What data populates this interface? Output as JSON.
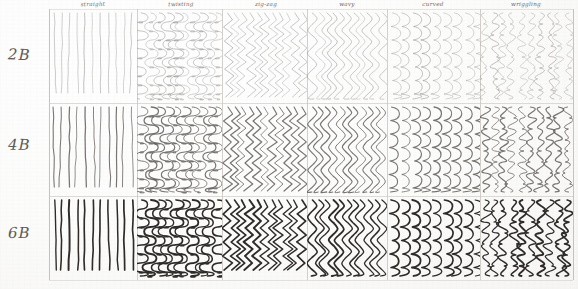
{
  "sheet": {
    "title": "Pencil mark-making chart",
    "description": "Hand-drawn grid of six stroke types rendered in three pencil grades",
    "paper_color": "#fdfdfc",
    "rule_color": "#b9b4ad"
  },
  "rows": [
    {
      "id": "row-2b",
      "label": "2B",
      "y": 56,
      "top": 9,
      "bottom": 103,
      "darkness": 0.3,
      "stroke_width": 0.62,
      "ink": "#8e8a86"
    },
    {
      "id": "row-4b",
      "label": "4B",
      "y": 146,
      "top": 103,
      "bottom": 196,
      "darkness": 0.62,
      "stroke_width": 1.0,
      "ink": "#5d5955"
    },
    {
      "id": "row-6b",
      "label": "6B",
      "y": 234,
      "top": 196,
      "bottom": 280,
      "darkness": 1.0,
      "stroke_width": 1.55,
      "ink": "#2e2b28"
    }
  ],
  "columns": [
    {
      "id": "col-straight",
      "label": "straight",
      "x": 49,
      "width": 88,
      "label_cx": 93,
      "stroke": "straight",
      "bundles": 3,
      "lines_per_bundle": 4
    },
    {
      "id": "col-twisting",
      "label": "twisting",
      "x": 137,
      "width": 85,
      "label_cx": 181,
      "stroke": "twisting",
      "bundles": 4,
      "lines_per_bundle": 1
    },
    {
      "id": "col-zigzag",
      "label": "zig-zag",
      "x": 222,
      "width": 85,
      "label_cx": 266,
      "stroke": "zigzag",
      "bundles": 4,
      "lines_per_bundle": 1
    },
    {
      "id": "col-wavy",
      "label": "wavy",
      "x": 307,
      "width": 80,
      "label_cx": 347,
      "stroke": "wavy",
      "bundles": 4,
      "lines_per_bundle": 1
    },
    {
      "id": "col-curved",
      "label": "curved",
      "x": 387,
      "width": 93,
      "label_cx": 433,
      "stroke": "curved",
      "bundles": 3,
      "lines_per_bundle": 1
    },
    {
      "id": "col-wriggling",
      "label": "wriggling",
      "x": 480,
      "width": 93,
      "label_cx": 526,
      "stroke": "wriggling",
      "bundles": 4,
      "lines_per_bundle": 1
    }
  ],
  "grid": {
    "left": 49,
    "right": 573,
    "top": 9,
    "bottom": 280,
    "horizontal_rules": [
      103,
      196
    ],
    "vertical_rules": [
      49,
      137,
      222,
      307,
      387,
      480,
      573
    ]
  }
}
